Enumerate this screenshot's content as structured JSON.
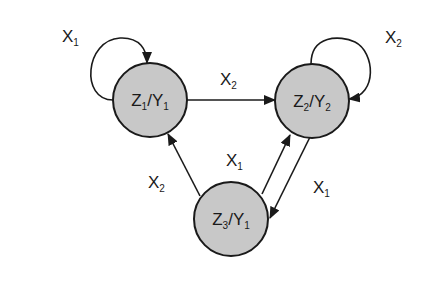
{
  "diagram": {
    "type": "state-machine",
    "nodes": [
      {
        "id": "s1",
        "state": "Z",
        "state_sub": "1",
        "output": "Y",
        "output_sub": "1"
      },
      {
        "id": "s2",
        "state": "Z",
        "state_sub": "2",
        "output": "Y",
        "output_sub": "2"
      },
      {
        "id": "s3",
        "state": "Z",
        "state_sub": "3",
        "output": "Y",
        "output_sub": "1"
      }
    ],
    "edges": [
      {
        "from": "s1",
        "to": "s1",
        "input": "X",
        "input_sub": "1"
      },
      {
        "from": "s1",
        "to": "s2",
        "input": "X",
        "input_sub": "2"
      },
      {
        "from": "s2",
        "to": "s2",
        "input": "X",
        "input_sub": "2"
      },
      {
        "from": "s3",
        "to": "s1",
        "input": "X",
        "input_sub": "2"
      },
      {
        "from": "s3",
        "to": "s2",
        "input": "X",
        "input_sub": "1"
      },
      {
        "from": "s2",
        "to": "s3",
        "input": "X",
        "input_sub": "1"
      }
    ],
    "colors": {
      "node_fill": "#c8c8c8",
      "stroke": "#1a1a1a"
    }
  }
}
